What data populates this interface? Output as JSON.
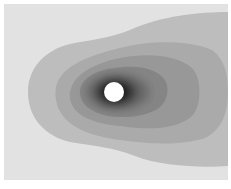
{
  "chart_data": {
    "type": "heatmap",
    "subtype": "filled-contour",
    "title": "",
    "xlabel": "",
    "ylabel": "",
    "legend": [],
    "grid": false,
    "obstacle": {
      "shape": "circle",
      "cx": 114,
      "cy": 92,
      "r": 10,
      "color": "#ffffff"
    },
    "background_color": "#e2e2e2",
    "levels": [
      {
        "level": 1,
        "color": "#bdbdbd"
      },
      {
        "level": 2,
        "color": "#aaaaaa"
      },
      {
        "level": 3,
        "color": "#989898"
      },
      {
        "level": 4,
        "color": "#858585"
      },
      {
        "level": 5,
        "color": "#6a6a6a"
      },
      {
        "level": 6,
        "color": "#444444"
      },
      {
        "level": 7,
        "color": "#1a1a1a"
      }
    ]
  }
}
